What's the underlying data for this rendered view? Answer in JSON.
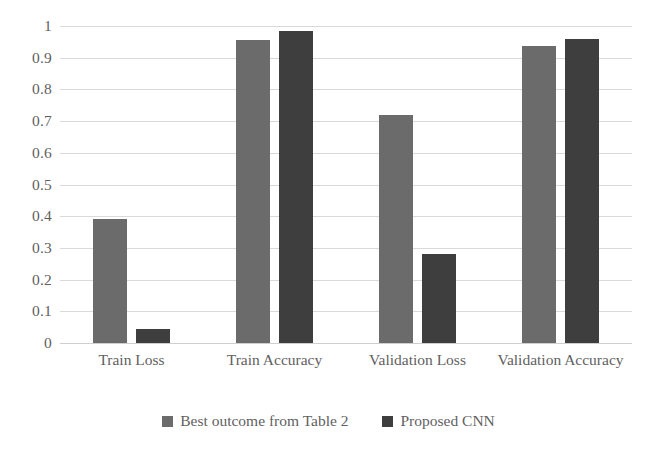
{
  "chart_data": {
    "type": "bar",
    "title": "",
    "subtitle": "",
    "xlabel": "",
    "ylabel": "",
    "categories": [
      "Train Loss",
      "Train Accuracy",
      "Validation Loss",
      "Validation Accuracy"
    ],
    "series": [
      {
        "name": "Best outcome from Table 2",
        "color": "#6b6b6b",
        "values": [
          0.39,
          0.955,
          0.72,
          0.937
        ]
      },
      {
        "name": "Proposed CNN",
        "color": "#3e3e3e",
        "values": [
          0.045,
          0.985,
          0.28,
          0.958
        ]
      }
    ],
    "ylim": [
      0,
      1
    ],
    "ytick_step": 0.1,
    "ytick_labels": [
      "1",
      "0.9",
      "0.8",
      "0.7",
      "0.6",
      "0.5",
      "0.4",
      "0.3",
      "0.2",
      "0.1",
      "0"
    ],
    "ytick_values": [
      1,
      0.9,
      0.8,
      0.7,
      0.6,
      0.5,
      0.4,
      0.3,
      0.2,
      0.1,
      0
    ],
    "grid": true,
    "grid_color": "#d9d9d9",
    "legend_position": "bottom",
    "background": "#ffffff",
    "text_color": "#5f5f5f"
  }
}
